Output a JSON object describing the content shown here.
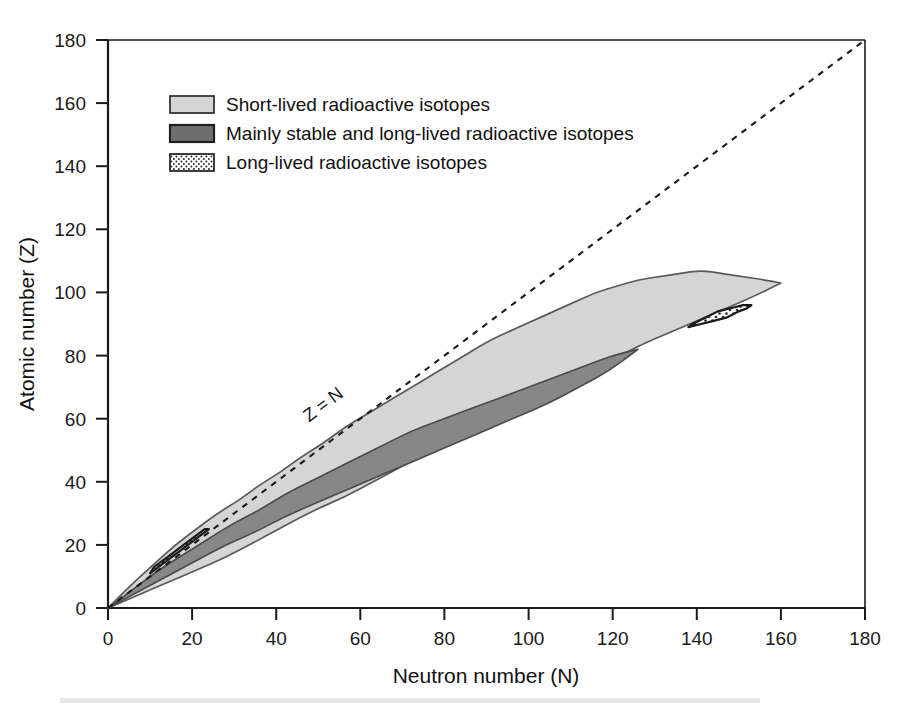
{
  "chart_data": {
    "type": "area",
    "title": "",
    "xlabel": "Neutron number (N)",
    "ylabel": "Atomic number (Z)",
    "xlim": [
      0,
      180
    ],
    "ylim": [
      0,
      180
    ],
    "xticks": [
      0,
      20,
      40,
      60,
      80,
      100,
      120,
      140,
      160,
      180
    ],
    "yticks": [
      0,
      20,
      40,
      60,
      80,
      100,
      120,
      140,
      160,
      180
    ],
    "grid": false,
    "legend_position": "upper-left-inside",
    "annotations": [
      {
        "text": "Z = N",
        "x": 52,
        "y": 63,
        "rotation": -37,
        "description": "label on the dashed diagonal reference line"
      }
    ],
    "reference_lines": [
      {
        "name": "z-equals-n-line",
        "style": "dashed",
        "from": [
          0,
          0
        ],
        "to": [
          180,
          180
        ],
        "color": "#1a1a1a"
      }
    ],
    "series": [
      {
        "name": "Short-lived radioactive isotopes",
        "key": "short_lived",
        "fill": "#d5d5d5",
        "stroke": "#5a5a5a",
        "pattern": "solid",
        "upper_boundary": [
          [
            0,
            0
          ],
          [
            6,
            8
          ],
          [
            11,
            14
          ],
          [
            16,
            20
          ],
          [
            21,
            25
          ],
          [
            26,
            30
          ],
          [
            31,
            34
          ],
          [
            36,
            39
          ],
          [
            41,
            43
          ],
          [
            46,
            48
          ],
          [
            51,
            52
          ],
          [
            56,
            57
          ],
          [
            61,
            61
          ],
          [
            66,
            65
          ],
          [
            71,
            69
          ],
          [
            76,
            73
          ],
          [
            81,
            77
          ],
          [
            86,
            81
          ],
          [
            91,
            85
          ],
          [
            96,
            88
          ],
          [
            101,
            91
          ],
          [
            106,
            94
          ],
          [
            111,
            97
          ],
          [
            116,
            100
          ],
          [
            121,
            102
          ],
          [
            126,
            104
          ],
          [
            131,
            105
          ],
          [
            136,
            106
          ],
          [
            141,
            107
          ],
          [
            146,
            106
          ],
          [
            151,
            105
          ],
          [
            156,
            104
          ],
          [
            160,
            103
          ]
        ],
        "lower_boundary": [
          [
            0,
            0
          ],
          [
            7,
            4
          ],
          [
            14,
            8
          ],
          [
            21,
            12
          ],
          [
            28,
            16
          ],
          [
            35,
            21
          ],
          [
            42,
            26
          ],
          [
            49,
            31
          ],
          [
            56,
            35
          ],
          [
            63,
            40
          ],
          [
            70,
            45
          ],
          [
            77,
            50
          ],
          [
            84,
            55
          ],
          [
            91,
            59
          ],
          [
            98,
            63
          ],
          [
            105,
            68
          ],
          [
            112,
            73
          ],
          [
            119,
            78
          ],
          [
            126,
            83
          ],
          [
            133,
            87
          ],
          [
            140,
            91
          ],
          [
            147,
            95
          ],
          [
            154,
            99
          ],
          [
            160,
            103
          ]
        ]
      },
      {
        "name": "Mainly stable and long-lived radioactive isotopes",
        "key": "mainly_stable",
        "fill": "#878787",
        "stroke": "#4a4a4a",
        "pattern": "solid",
        "upper_boundary": [
          [
            0,
            0
          ],
          [
            6,
            6
          ],
          [
            12,
            12
          ],
          [
            18,
            17
          ],
          [
            24,
            22
          ],
          [
            30,
            27
          ],
          [
            36,
            31
          ],
          [
            42,
            36
          ],
          [
            48,
            40
          ],
          [
            54,
            44
          ],
          [
            60,
            48
          ],
          [
            66,
            52
          ],
          [
            72,
            56
          ],
          [
            78,
            59
          ],
          [
            84,
            62
          ],
          [
            90,
            65
          ],
          [
            96,
            68
          ],
          [
            102,
            71
          ],
          [
            108,
            74
          ],
          [
            114,
            77
          ],
          [
            120,
            80
          ],
          [
            126,
            82
          ]
        ],
        "lower_boundary": [
          [
            0,
            0
          ],
          [
            7,
            5
          ],
          [
            14,
            10
          ],
          [
            21,
            15
          ],
          [
            28,
            20
          ],
          [
            35,
            24
          ],
          [
            42,
            29
          ],
          [
            49,
            33
          ],
          [
            56,
            37
          ],
          [
            63,
            41
          ],
          [
            70,
            45
          ],
          [
            77,
            49
          ],
          [
            84,
            53
          ],
          [
            91,
            57
          ],
          [
            98,
            61
          ],
          [
            105,
            65
          ],
          [
            112,
            70
          ],
          [
            119,
            75
          ],
          [
            126,
            82
          ]
        ]
      },
      {
        "name": "Long-lived radioactive isotopes",
        "key": "long_lived",
        "fill": "#ffffff",
        "stroke": "#1a1a1a",
        "pattern": "dotted",
        "regions": [
          {
            "name": "actinide-island",
            "outline": [
              [
                138,
                89
              ],
              [
                141,
                90
              ],
              [
                144,
                91
              ],
              [
                147,
                92
              ],
              [
                150,
                94
              ],
              [
                152,
                95
              ],
              [
                153,
                96
              ],
              [
                151,
                96
              ],
              [
                148,
                95
              ],
              [
                145,
                94
              ],
              [
                142,
                92
              ],
              [
                139,
                90
              ]
            ]
          },
          {
            "name": "light-element-sliver",
            "outline": [
              [
                10,
                11
              ],
              [
                14,
                15
              ],
              [
                18,
                19
              ],
              [
                22,
                23
              ],
              [
                24,
                25
              ],
              [
                23,
                25
              ],
              [
                19,
                21
              ],
              [
                15,
                17
              ],
              [
                11,
                13
              ]
            ]
          }
        ]
      }
    ]
  },
  "legend": {
    "items": [
      {
        "label": "Short-lived radioactive isotopes",
        "swatch": "light-gray-swatch",
        "fill": "#d5d5d5"
      },
      {
        "label": "Mainly stable and long-lived radioactive isotopes",
        "swatch": "dark-gray-swatch",
        "fill": "#6e6e6e"
      },
      {
        "label": "Long-lived radioactive isotopes",
        "swatch": "dotted-swatch",
        "fill": "#ffffff"
      }
    ]
  },
  "axes": {
    "x_title": "Neutron number (N)",
    "y_title": "Atomic number (Z)",
    "x_ticks": [
      "0",
      "20",
      "40",
      "60",
      "80",
      "100",
      "120",
      "140",
      "160",
      "180"
    ],
    "y_ticks": [
      "0",
      "20",
      "40",
      "60",
      "80",
      "100",
      "120",
      "140",
      "160",
      "180"
    ]
  },
  "annotation": {
    "z_equals_n": "Z = N"
  },
  "colors": {
    "short_lived_fill": "#d5d5d5",
    "mainly_stable_fill": "#878787",
    "long_lived_fill": "#ffffff",
    "axis": "#1a1a1a",
    "background": "#ffffff"
  }
}
